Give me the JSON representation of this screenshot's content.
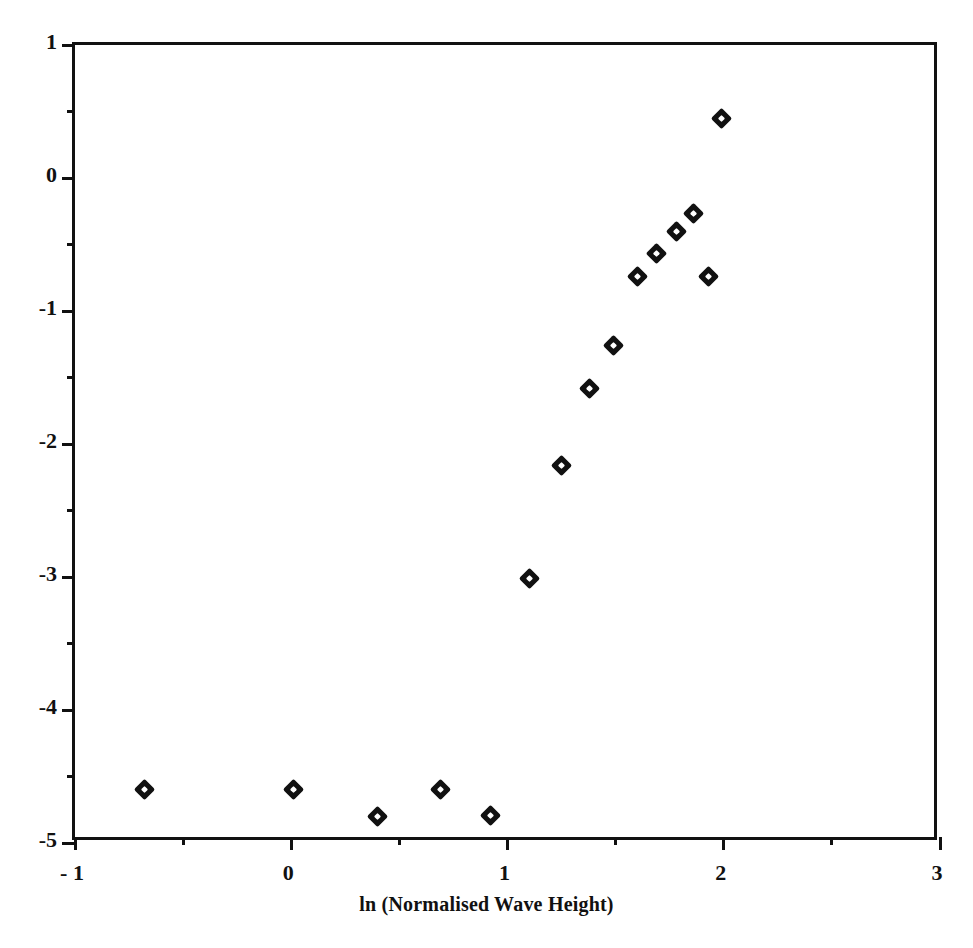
{
  "chart_data": {
    "type": "scatter",
    "title": "",
    "subtitle": "",
    "xlabel": "ln (Normalised Wave Height)",
    "ylabel": "",
    "xlim": [
      -1,
      3
    ],
    "ylim": [
      -5,
      1
    ],
    "grid": false,
    "legend": null,
    "xticks": [
      -1,
      0,
      1,
      2,
      3
    ],
    "xtick_labels": [
      "- 1",
      "0",
      "1",
      "2",
      "3"
    ],
    "xminorticks": [
      -0.5,
      0.5,
      1.5,
      2.5
    ],
    "yticks": [
      1,
      0,
      -1,
      -2,
      -3,
      -4,
      -5
    ],
    "ytick_labels": [
      "1",
      "0",
      "-1",
      "-2",
      "-3",
      "-4",
      "-5"
    ],
    "yminorticks": [
      0.5,
      -0.5,
      -1.5,
      -2.5,
      -3.5,
      -4.5
    ],
    "marker": "diamond",
    "marker_color": "#111111",
    "points": [
      {
        "x": -0.68,
        "y": -4.6
      },
      {
        "x": 0.01,
        "y": -4.6
      },
      {
        "x": 0.4,
        "y": -4.8
      },
      {
        "x": 0.69,
        "y": -4.6
      },
      {
        "x": 0.92,
        "y": -4.79
      },
      {
        "x": 1.1,
        "y": -3.01
      },
      {
        "x": 1.25,
        "y": -2.16
      },
      {
        "x": 1.38,
        "y": -1.58
      },
      {
        "x": 1.49,
        "y": -1.26
      },
      {
        "x": 1.6,
        "y": -0.74
      },
      {
        "x": 1.69,
        "y": -0.57
      },
      {
        "x": 1.78,
        "y": -0.4
      },
      {
        "x": 1.86,
        "y": -0.27
      },
      {
        "x": 1.93,
        "y": -0.74
      },
      {
        "x": 1.99,
        "y": 0.45
      }
    ]
  },
  "figure": {
    "background_color": "#ffffff",
    "axis_color": "#111111"
  }
}
